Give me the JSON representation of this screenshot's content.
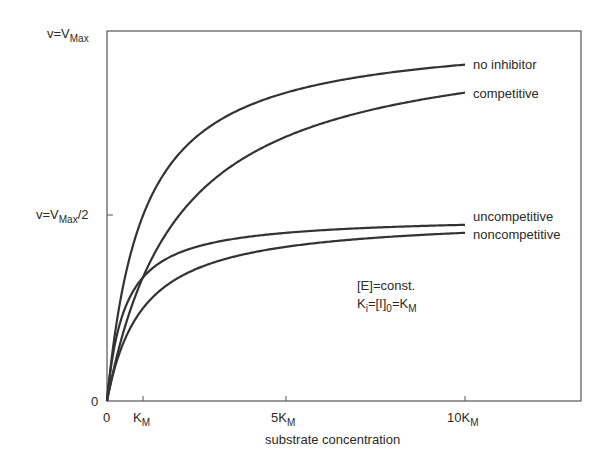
{
  "chart_data": {
    "type": "line",
    "title": "",
    "xlabel": "substrate concentration",
    "ylabel": "",
    "x_ticks": [
      {
        "value": 0,
        "label": "0"
      },
      {
        "value": 1,
        "label": "K",
        "sub": "M"
      },
      {
        "value": 5,
        "label": "5K",
        "sub": "M"
      },
      {
        "value": 10,
        "label": "10K",
        "sub": "M"
      }
    ],
    "y_ticks": [
      {
        "value": 0,
        "label": "0"
      },
      {
        "value": 0.5,
        "label": "v=V",
        "sub": "Max",
        "suffix": "/2"
      },
      {
        "value": 1.0,
        "label": "v=V",
        "sub": "Max",
        "suffix": ""
      }
    ],
    "xlim": [
      0,
      13.2
    ],
    "ylim": [
      0,
      1.0
    ],
    "grid": false,
    "units": {
      "x": "multiples of K_M",
      "y": "fraction of V_Max"
    },
    "series": [
      {
        "name": "no inhibitor",
        "vmax": 1.0,
        "km": 1.0,
        "end_value": 0.909
      },
      {
        "name": "competitive",
        "vmax": 1.0,
        "km": 2.0,
        "end_value": 0.833
      },
      {
        "name": "uncompetitive",
        "vmax": 0.5,
        "km": 0.5,
        "end_value": 0.476
      },
      {
        "name": "noncompetitive",
        "vmax": 0.5,
        "km": 1.0,
        "end_value": 0.455
      }
    ],
    "x_range_of_curves": [
      0,
      10
    ],
    "annotations": [
      {
        "text": "[E]=const."
      },
      {
        "text": "K",
        "sub": "i",
        "rest": "=[I]",
        "sub2": "0",
        "rest2": "=K",
        "sub3": "M"
      }
    ]
  },
  "labels": {
    "y_max": "v=V",
    "y_max_sub": "Max",
    "y_half": "v=V",
    "y_half_sub": "Max",
    "y_half_suffix": "/2",
    "y_zero": "0",
    "x_zero": "0",
    "x_km": "K",
    "x_km_sub": "M",
    "x_5km": "5K",
    "x_5km_sub": "M",
    "x_10km": "10K",
    "x_10km_sub": "M",
    "xlabel": "substrate concentration",
    "series_no_inhibitor": "no inhibitor",
    "series_competitive": "competitive",
    "series_uncompetitive": "uncompetitive",
    "series_noncompetitive": "noncompetitive",
    "annot_line1": "[E]=const.",
    "annot_line2_a": "K",
    "annot_line2_b": "i",
    "annot_line2_c": "=[I]",
    "annot_line2_d": "0",
    "annot_line2_e": "=K",
    "annot_line2_f": "M"
  },
  "colors": {
    "axis": "#555555",
    "curve": "#333333",
    "text": "#2a2a2a"
  }
}
